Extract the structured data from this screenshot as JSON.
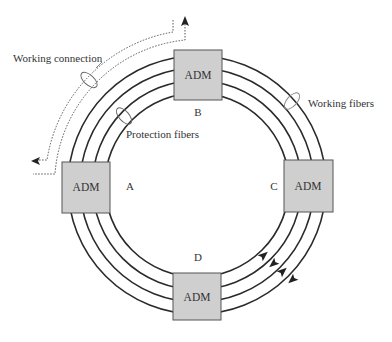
{
  "diagram": {
    "type": "SONET/SDH bidirectional line-switched ring",
    "colors": {
      "fiber": "#2a2a2a",
      "adm_fill": "#cfcfcf",
      "adm_stroke": "#555555",
      "dashed": "#555555",
      "text": "#333333"
    },
    "labels": {
      "working_connection": "Working connection",
      "protection_fibers": "Protection fibers",
      "working_fibers": "Working fibers"
    },
    "nodes": [
      {
        "id": "A",
        "label": "A",
        "device": "ADM"
      },
      {
        "id": "B",
        "label": "B",
        "device": "ADM"
      },
      {
        "id": "C",
        "label": "C",
        "device": "ADM"
      },
      {
        "id": "D",
        "label": "D",
        "device": "ADM"
      }
    ],
    "fiber_count": 4
  }
}
